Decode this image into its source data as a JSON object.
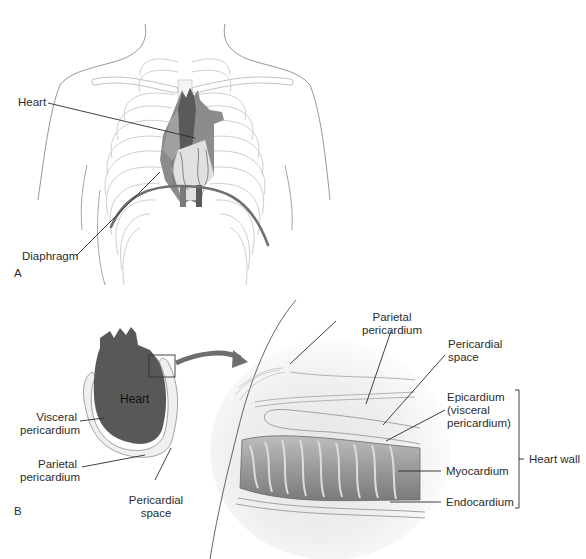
{
  "figure": {
    "panels": [
      {
        "id": "A",
        "letter": "A",
        "description": "Frontal view of thorax showing heart position within rib cage above diaphragm",
        "labels": {
          "heart": "Heart",
          "diaphragm": "Diaphragm"
        }
      },
      {
        "id": "B",
        "letter": "B",
        "description": "Heart within pericardial sac with magnified cross-section of heart wall",
        "heart_label": "Heart",
        "left_labels": {
          "visceral_line1": "Visceral",
          "visceral_line2": "pericardium",
          "parietal_line1": "Parietal",
          "parietal_line2": "pericardium",
          "space_line1": "Pericardial",
          "space_line2": "space"
        },
        "detail_labels": {
          "parietal_line1": "Parietal",
          "parietal_line2": "pericardium",
          "space_line1": "Pericardial",
          "space_line2": "space",
          "epicardium_line1": "Epicardium",
          "epicardium_line2": "(visceral",
          "epicardium_line3": "pericardium)",
          "myocardium": "Myocardium",
          "endocardium": "Endocardium",
          "heart_wall": "Heart wall"
        }
      }
    ],
    "colors": {
      "outline": "#9a9a9a",
      "rib": "#c8c8c8",
      "heart_dark": "#5a5a5a",
      "heart_mid": "#8c8c8c",
      "heart_light": "#d8d8d8",
      "leader": "#2a2a2a",
      "diaphragm": "#707070"
    }
  }
}
